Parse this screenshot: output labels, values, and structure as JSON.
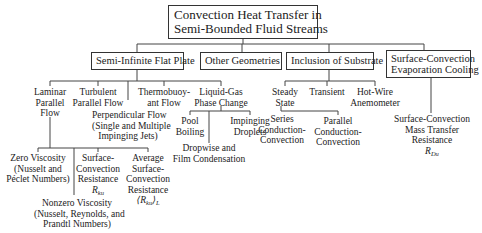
{
  "root": {
    "line1": "Convection Heat Transfer in",
    "line2": "Semi-Bounded Fluid Streams"
  },
  "categories": [
    {
      "label": "Semi-Infinite Flat Plate"
    },
    {
      "label": "Other Geometries"
    },
    {
      "label": "Inclusion of Substrate"
    },
    {
      "line1": "Surface-Convection",
      "line2": "Evaporation Cooling"
    }
  ],
  "flat_plate": {
    "laminar": [
      "Laminar",
      "Parallel",
      "Flow"
    ],
    "turbulent": [
      "Turbulent",
      "Parallel Flow"
    ],
    "perpendicular": [
      "Perpendicular Flow",
      "(Single and Multiple",
      "Impinging Jets)"
    ],
    "thermobuoyant": [
      "Thermobuoy-",
      "ant Flow"
    ],
    "liquid_gas": [
      "Liquid-Gas",
      "Phase Change"
    ]
  },
  "laminar_children": {
    "zero_viscosity": [
      "Zero Viscosity",
      "(Nusselt and",
      "Péclet Numbers)"
    ],
    "nonzero_viscosity": [
      "Nonzero Viscosity",
      "(Nusselt, Reynolds, and",
      "Prandtl Numbers)"
    ],
    "surface_resistance": [
      "Surface-",
      "Convection",
      "Resistance",
      "R",
      "ku"
    ],
    "avg_resistance": [
      "Average",
      "Surface-",
      "Convection",
      "Resistance",
      "⟨R",
      "ku",
      "⟩",
      "L"
    ]
  },
  "phase_change": {
    "pool_boiling": [
      "Pool",
      "Boiling"
    ],
    "impinging_droplets": [
      "Impinging",
      "Droplets"
    ],
    "condensation": [
      "Dropwise and",
      "Film Condensation"
    ]
  },
  "substrate": {
    "steady": [
      "Steady",
      "State"
    ],
    "transient": [
      "Transient"
    ],
    "hotwire": [
      "Hot-Wire",
      "Anemometer"
    ],
    "series": [
      "Series",
      "Conduction-",
      "Convection"
    ],
    "parallel": [
      "Parallel",
      "Conduction-",
      "Convection"
    ]
  },
  "evaporation": {
    "mass_transfer": [
      "Surface-Convection",
      "Mass Transfer",
      "Resistance",
      "R",
      "Du"
    ]
  }
}
